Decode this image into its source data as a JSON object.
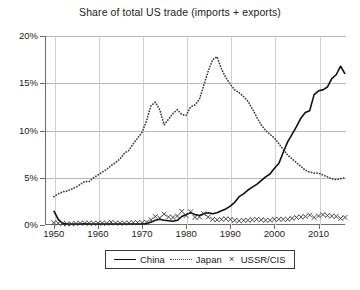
{
  "chart_data": {
    "type": "line",
    "title": "Share of total US trade (imports + exports)",
    "xlabel": "",
    "ylabel": "",
    "xlim": [
      1948,
      2016
    ],
    "ylim": [
      0,
      20
    ],
    "grid": true,
    "legend_position": "bottom-center",
    "x_ticks": [
      "1950",
      "1960",
      "1970",
      "1980",
      "1990",
      "2000",
      "2010"
    ],
    "x_tick_values": [
      1950,
      1960,
      1970,
      1980,
      1990,
      2000,
      2010
    ],
    "y_ticks": [
      "0%",
      "5%",
      "10%",
      "15%",
      "20%"
    ],
    "y_tick_values": [
      0,
      5,
      10,
      15,
      20
    ],
    "series": [
      {
        "name": "China",
        "style": "solid",
        "color": "#111111",
        "x": [
          1950,
          1951,
          1952,
          1953,
          1954,
          1955,
          1956,
          1957,
          1958,
          1959,
          1960,
          1961,
          1962,
          1963,
          1964,
          1965,
          1966,
          1967,
          1968,
          1969,
          1970,
          1971,
          1972,
          1973,
          1974,
          1975,
          1976,
          1977,
          1978,
          1979,
          1980,
          1981,
          1982,
          1983,
          1984,
          1985,
          1986,
          1987,
          1988,
          1989,
          1990,
          1991,
          1992,
          1993,
          1994,
          1995,
          1996,
          1997,
          1998,
          1999,
          2000,
          2001,
          2002,
          2003,
          2004,
          2005,
          2006,
          2007,
          2008,
          2009,
          2010,
          2011,
          2012,
          2013,
          2014,
          2015,
          2016
        ],
        "values": [
          1.5,
          0.6,
          0.15,
          0.1,
          0.1,
          0.1,
          0.1,
          0.12,
          0.1,
          0.1,
          0.1,
          0.1,
          0.1,
          0.1,
          0.1,
          0.1,
          0.1,
          0.1,
          0.1,
          0.1,
          0.12,
          0.15,
          0.3,
          0.5,
          0.6,
          0.5,
          0.45,
          0.4,
          0.5,
          0.9,
          1.1,
          1.3,
          1.1,
          1.0,
          1.2,
          1.3,
          1.2,
          1.3,
          1.5,
          1.7,
          2.0,
          2.4,
          3.0,
          3.3,
          3.7,
          4.0,
          4.3,
          4.7,
          5.1,
          5.4,
          6.0,
          6.5,
          7.7,
          8.8,
          9.6,
          10.4,
          11.3,
          11.9,
          12.1,
          13.8,
          14.2,
          14.3,
          14.6,
          15.5,
          15.9,
          16.8,
          16.0
        ]
      },
      {
        "name": "Japan",
        "style": "dotted",
        "color": "#3b3b3b",
        "x": [
          1950,
          1951,
          1952,
          1953,
          1954,
          1955,
          1956,
          1957,
          1958,
          1959,
          1960,
          1961,
          1962,
          1963,
          1964,
          1965,
          1966,
          1967,
          1968,
          1969,
          1970,
          1971,
          1972,
          1973,
          1974,
          1975,
          1976,
          1977,
          1978,
          1979,
          1980,
          1981,
          1982,
          1983,
          1984,
          1985,
          1986,
          1987,
          1988,
          1989,
          1990,
          1991,
          1992,
          1993,
          1994,
          1995,
          1996,
          1997,
          1998,
          1999,
          2000,
          2001,
          2002,
          2003,
          2004,
          2005,
          2006,
          2007,
          2008,
          2009,
          2010,
          2011,
          2012,
          2013,
          2014,
          2015,
          2016
        ],
        "values": [
          3.0,
          3.3,
          3.5,
          3.6,
          3.8,
          4.0,
          4.3,
          4.6,
          4.6,
          5.0,
          5.3,
          5.6,
          5.9,
          6.3,
          6.6,
          7.0,
          7.6,
          7.9,
          8.6,
          9.2,
          9.8,
          11.0,
          12.6,
          13.0,
          12.2,
          10.6,
          11.2,
          11.8,
          12.2,
          11.7,
          11.6,
          12.5,
          12.7,
          13.3,
          14.8,
          16.3,
          17.5,
          17.8,
          16.5,
          15.6,
          14.9,
          14.3,
          14.0,
          13.6,
          13.1,
          12.3,
          11.4,
          10.6,
          10.0,
          9.6,
          9.2,
          8.6,
          8.0,
          7.4,
          7.0,
          6.6,
          6.2,
          5.8,
          5.6,
          5.5,
          5.5,
          5.3,
          5.1,
          4.9,
          4.8,
          4.9,
          5.0
        ]
      },
      {
        "name": "USSR/CIS",
        "style": "cross-markers",
        "color": "#333333",
        "x": [
          1950,
          1951,
          1952,
          1953,
          1954,
          1955,
          1956,
          1957,
          1958,
          1959,
          1960,
          1961,
          1962,
          1963,
          1964,
          1965,
          1966,
          1967,
          1968,
          1969,
          1970,
          1971,
          1972,
          1973,
          1974,
          1975,
          1976,
          1977,
          1978,
          1979,
          1980,
          1981,
          1982,
          1983,
          1984,
          1985,
          1986,
          1987,
          1988,
          1989,
          1990,
          1991,
          1992,
          1993,
          1994,
          1995,
          1996,
          1997,
          1998,
          1999,
          2000,
          2001,
          2002,
          2003,
          2004,
          2005,
          2006,
          2007,
          2008,
          2009,
          2010,
          2011,
          2012,
          2013,
          2014,
          2015,
          2016
        ],
        "values": [
          0.25,
          0.2,
          0.15,
          0.12,
          0.12,
          0.15,
          0.2,
          0.2,
          0.18,
          0.18,
          0.2,
          0.2,
          0.18,
          0.3,
          0.2,
          0.2,
          0.2,
          0.22,
          0.25,
          0.25,
          0.25,
          0.3,
          0.55,
          0.9,
          0.75,
          1.15,
          0.85,
          0.8,
          0.95,
          1.45,
          1.0,
          1.4,
          0.8,
          0.85,
          1.2,
          0.85,
          0.6,
          0.55,
          0.6,
          0.65,
          0.6,
          0.5,
          0.45,
          0.5,
          0.5,
          0.55,
          0.6,
          0.55,
          0.5,
          0.5,
          0.6,
          0.6,
          0.6,
          0.6,
          0.7,
          0.8,
          0.85,
          0.9,
          1.05,
          0.8,
          0.95,
          1.1,
          1.0,
          0.95,
          0.9,
          0.7,
          0.8
        ]
      }
    ]
  },
  "legend": {
    "entries": [
      {
        "label": "China",
        "marker": "solid-line-swatch"
      },
      {
        "label": "Japan",
        "marker": "dotted-line-swatch"
      },
      {
        "label": "USSR/CIS",
        "marker": "cross-marker-swatch"
      }
    ],
    "cross_glyph": "×"
  }
}
